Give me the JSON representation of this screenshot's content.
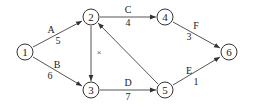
{
  "diagram": {
    "type": "activity-on-arrow network",
    "nodes": [
      {
        "id": "1",
        "label": "1",
        "x": 25,
        "y": 52
      },
      {
        "id": "2",
        "label": "2",
        "x": 91,
        "y": 17
      },
      {
        "id": "3",
        "label": "3",
        "x": 91,
        "y": 90
      },
      {
        "id": "4",
        "label": "4",
        "x": 165,
        "y": 17
      },
      {
        "id": "5",
        "label": "5",
        "x": 165,
        "y": 90
      },
      {
        "id": "6",
        "label": "6",
        "x": 229,
        "y": 52
      }
    ],
    "edges": [
      {
        "from": "1",
        "to": "2",
        "activity": "A",
        "duration": "5"
      },
      {
        "from": "1",
        "to": "3",
        "activity": "B",
        "duration": "6"
      },
      {
        "from": "2",
        "to": "4",
        "activity": "C",
        "duration": "4"
      },
      {
        "from": "3",
        "to": "5",
        "activity": "D",
        "duration": "7"
      },
      {
        "from": "4",
        "to": "6",
        "activity": "F",
        "duration": "3"
      },
      {
        "from": "5",
        "to": "6",
        "activity": "E",
        "duration": "1"
      },
      {
        "from": "2",
        "to": "3",
        "activity": "",
        "duration": "",
        "mark": "×"
      },
      {
        "from": "5",
        "to": "2",
        "activity": "",
        "duration": ""
      }
    ]
  }
}
